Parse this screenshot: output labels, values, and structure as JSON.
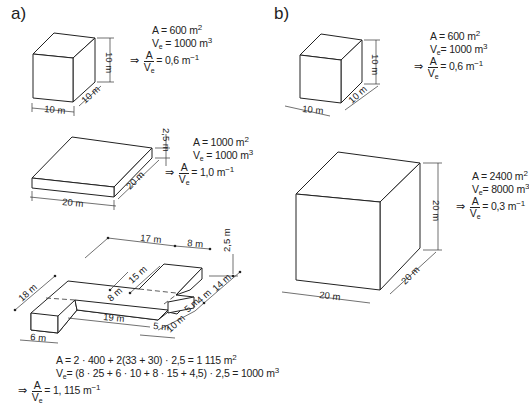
{
  "panels": {
    "a": {
      "label": "a)",
      "cube": {
        "dims": {
          "width": "10 m",
          "depth": "10 m",
          "height": "10 m"
        },
        "formula": {
          "area": "A = 600 m",
          "area_exp": "2",
          "volume_pre": "V",
          "volume_sub": "e",
          "volume": "= 1000 m",
          "volume_exp": "3",
          "arrow": "⇒",
          "ratio_num": "A",
          "ratio_den_pre": "V",
          "ratio_den_sub": "e",
          "ratio_val": "= 0,6 m",
          "ratio_exp": "−1"
        }
      },
      "slab": {
        "dims": {
          "width": "20 m",
          "depth": "20 m",
          "height": "2,5 m"
        },
        "formula": {
          "area": "A = 1000 m",
          "area_exp": "2",
          "volume_pre": "V",
          "volume_sub": "e",
          "volume": "= 1000 m",
          "volume_exp": "3",
          "arrow": "⇒",
          "ratio_num": "A",
          "ratio_den_pre": "V",
          "ratio_den_sub": "e",
          "ratio_val": "= 1,0 m",
          "ratio_exp": "−1"
        }
      },
      "complex": {
        "dims": {
          "top_left_length": "17 m",
          "top_right_width": "8 m",
          "height": "2,5 m",
          "left_depth": "18 m",
          "wing_depth": "15 m",
          "inner_depth": "8 m",
          "front_length": "19 m",
          "left_width": "6 m",
          "step_width": "5 m",
          "right_depth_1": "14 m",
          "right_depth_2": "4 m",
          "right_depth_3": "5 m",
          "right_depth_4": "10 m"
        },
        "formula": {
          "area": "A = 2 · 400 + 2(33 + 30) · 2,5 = 1 115 m",
          "area_exp": "2",
          "volume_pre": "V",
          "volume_sub": "e",
          "volume": "= (8 · 25 + 6 · 10 + 8 · 15 + 4,5) · 2,5 = 1000 m",
          "volume_exp": "3",
          "arrow": "⇒",
          "ratio_num": "A",
          "ratio_den_pre": "V",
          "ratio_den_sub": "e",
          "ratio_val": "= 1, 115 m",
          "ratio_exp": "−1"
        }
      }
    },
    "b": {
      "label": "b)",
      "small_cube": {
        "dims": {
          "width": "10 m",
          "depth": "10 m",
          "height": "10 m"
        },
        "formula": {
          "area": "A = 600 m",
          "area_exp": "2",
          "volume_pre": "V",
          "volume_sub": "e",
          "volume": "= 1000 m",
          "volume_exp": "3",
          "arrow": "⇒",
          "ratio_num": "A",
          "ratio_den_pre": "V",
          "ratio_den_sub": "e",
          "ratio_val": "= 0,6 m",
          "ratio_exp": "−1"
        }
      },
      "large_cube": {
        "dims": {
          "width": "20 m",
          "depth": "20 m",
          "height": "20 m"
        },
        "formula": {
          "area": "A = 2400 m",
          "area_exp": "2",
          "volume_pre": "V",
          "volume_sub": "e",
          "volume": "= 8000 m",
          "volume_exp": "3",
          "arrow": "⇒",
          "ratio_num": "A",
          "ratio_den_pre": "V",
          "ratio_den_sub": "e",
          "ratio_val": "= 0,3 m",
          "ratio_exp": "−1"
        }
      }
    }
  }
}
